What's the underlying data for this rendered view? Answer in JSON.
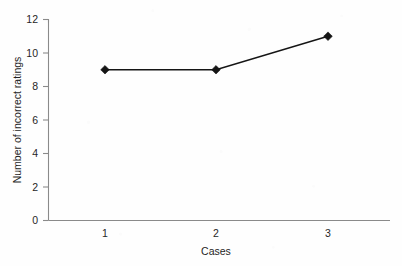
{
  "chart_data": {
    "type": "line",
    "title": "",
    "subtitle": "",
    "xlabel": "Cases",
    "ylabel": "Number of incorrect ratings",
    "categories": [
      "1",
      "2",
      "3"
    ],
    "x": [
      1,
      2,
      3
    ],
    "values": [
      9,
      9,
      11
    ],
    "series": [
      {
        "name": "Number of incorrect ratings",
        "values": [
          9,
          9,
          11
        ]
      }
    ],
    "xlim": [
      0.5,
      3.5
    ],
    "ylim": [
      0,
      12
    ],
    "xticks": [
      "1",
      "2",
      "3"
    ],
    "yticks": [
      "0",
      "2",
      "4",
      "6",
      "8",
      "10",
      "12"
    ],
    "ytick_values": [
      0,
      2,
      4,
      6,
      8,
      10,
      12
    ],
    "grid": false,
    "legend": false,
    "legend_position": "none",
    "marker": "diamond",
    "line_color": "#151515",
    "marker_color": "#151515",
    "axis_color": "#8a8a8a",
    "background_color": "#fefefe",
    "annotations": []
  }
}
